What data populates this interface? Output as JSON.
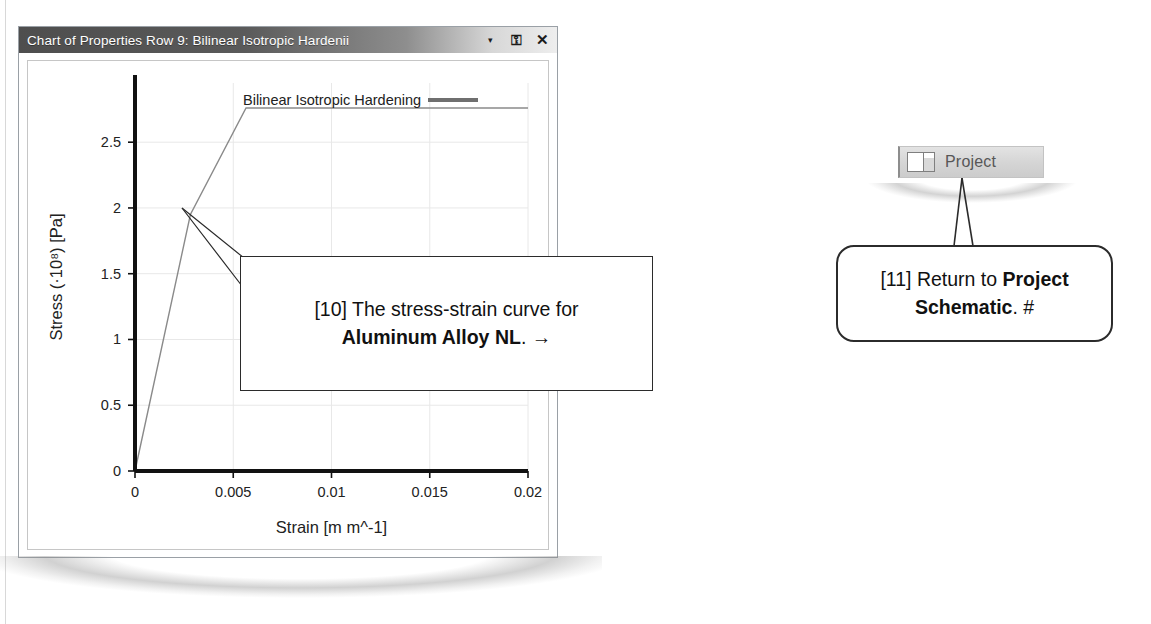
{
  "window": {
    "title": "Chart of Properties Row 9: Bilinear Isotropic Hardenii",
    "buttons": {
      "dropdown": "▾",
      "pin": "╤",
      "close": "✕"
    }
  },
  "chart_data": {
    "type": "line",
    "title": "",
    "xlabel": "Strain [m m^-1]",
    "ylabel": "Stress (·10⁸) [Pa]",
    "legend": [
      "Bilinear Isotropic Hardening"
    ],
    "legend_position": "top-center",
    "grid": true,
    "xlim": [
      0,
      0.02
    ],
    "ylim": [
      0,
      2.95
    ],
    "xticks": [
      "0",
      "0.005",
      "0.01",
      "0.015",
      "0.02"
    ],
    "xtick_values": [
      0,
      0.005,
      0.01,
      0.015,
      0.02
    ],
    "yticks": [
      "0",
      "0.5",
      "1",
      "1.5",
      "2",
      "2.5"
    ],
    "ytick_values": [
      0,
      0.5,
      1,
      1.5,
      2,
      2.5
    ],
    "series": [
      {
        "name": "Bilinear Isotropic Hardening",
        "color": "#8a8a8a",
        "x": [
          0,
          0.00282,
          0.00565,
          0.02
        ],
        "y": [
          0,
          1.95,
          2.76,
          2.76
        ]
      }
    ]
  },
  "callouts": {
    "chart": {
      "index": "[10]",
      "line1_prefix": "[10] ",
      "line1": "The stress-strain curve for",
      "line2_bold": "Aluminum Alloy NL",
      "line2_suffix": ". →"
    },
    "project": {
      "index": "[11]",
      "line1_prefix": "[11] ",
      "line1": "Return to ",
      "bold1": "Project",
      "bold2": "Schematic",
      "suffix": ". #"
    }
  },
  "toolbar": {
    "project_label": "Project"
  },
  "colors": {
    "titlebar_dark": "#4e4e4e",
    "curve": "#8a8a8a",
    "axis": "#111111",
    "grid": "#e8e8e8"
  }
}
